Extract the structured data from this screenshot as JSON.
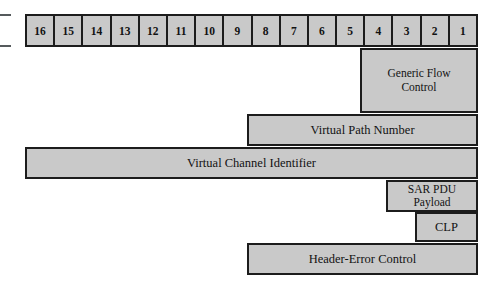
{
  "diagram": {
    "colors": {
      "fill": "#c9c9c9",
      "stroke": "#1c1c1c",
      "background": "#ffffff",
      "tick": "#555a5c"
    },
    "bit_ruler": {
      "name": "bit-position-ruler",
      "cells": [
        {
          "label": "16"
        },
        {
          "label": "15"
        },
        {
          "label": "14"
        },
        {
          "label": "13"
        },
        {
          "label": "12"
        },
        {
          "label": "11"
        },
        {
          "label": "10"
        },
        {
          "label": "9"
        },
        {
          "label": "8"
        },
        {
          "label": "7"
        },
        {
          "label": "6"
        },
        {
          "label": "5"
        },
        {
          "label": "4"
        },
        {
          "label": "3"
        },
        {
          "label": "2"
        },
        {
          "label": "1"
        }
      ]
    },
    "fields": [
      {
        "id": "generic-flow-control",
        "lines": [
          "Generic Flow",
          "Control"
        ],
        "x": 360,
        "y": 48,
        "w": 118,
        "h": 65
      },
      {
        "id": "virtual-path-number",
        "lines": [
          "Virtual Path Number"
        ],
        "x": 247,
        "y": 114,
        "w": 231,
        "h": 32
      },
      {
        "id": "virtual-channel-identifier",
        "lines": [
          "Virtual Channel Identifier"
        ],
        "x": 25,
        "y": 147,
        "w": 453,
        "h": 32
      },
      {
        "id": "sar-pdu-payload",
        "lines": [
          "SAR PDU",
          "Payload"
        ],
        "x": 386,
        "y": 180,
        "w": 92,
        "h": 32
      },
      {
        "id": "clp",
        "lines": [
          "CLP"
        ],
        "x": 415,
        "y": 212,
        "w": 63,
        "h": 30
      },
      {
        "id": "header-error-control",
        "lines": [
          "Header-Error Control"
        ],
        "x": 247,
        "y": 243,
        "w": 231,
        "h": 32
      }
    ],
    "edge_ticks": [
      {
        "id": "ruler-top-tick",
        "y": 14
      },
      {
        "id": "ruler-bottom-tick",
        "y": 45
      }
    ]
  }
}
